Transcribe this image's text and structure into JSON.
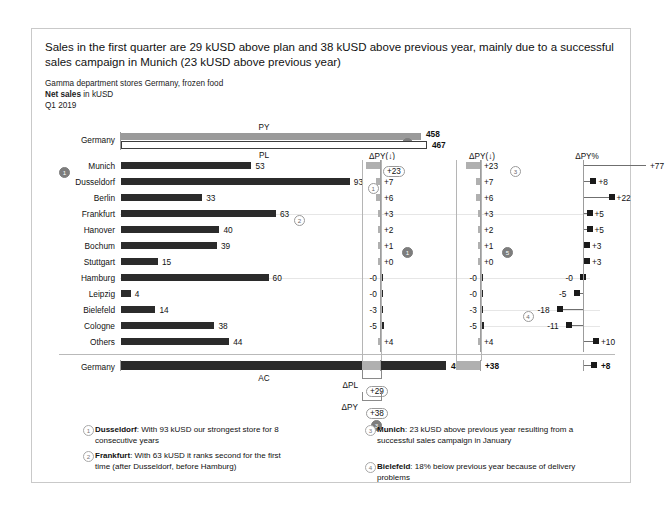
{
  "header": {
    "title": "Sales in the first quarter are 29 kUSD above plan and 38 kUSD above previous year, mainly due to a successful sales campaign in Munich (23 kUSD above previous year)",
    "subtitle_org": "Gamma department stores Germany, frozen food",
    "subtitle_measure_bold": "Net sales",
    "subtitle_measure_rest": " in kUSD",
    "subtitle_period": "Q1 2019"
  },
  "labels": {
    "germany": "Germany",
    "py": "PY",
    "pl": "PL",
    "ac": "AC",
    "delta_py_header": "ΔPY(↓)",
    "delta_py_pct_header": "ΔPY%",
    "delta_pl_bracket": "ΔPL",
    "delta_py_bracket": "ΔPY"
  },
  "totals": {
    "py_value": 458,
    "py_label": "458",
    "pl_value": 467,
    "pl_label": "467",
    "ac_value": 496,
    "ac_label": "496",
    "delta_pl_label": "+29",
    "delta_py_label": "+38",
    "delta_py_col2_label": "+38",
    "delta_py_pct_label": "+8",
    "py_marker": "2",
    "delta_pl_marker": "3"
  },
  "chart_data": {
    "type": "bar",
    "xlabel": "",
    "ylabel": "",
    "categories": [
      "Munich",
      "Dusseldorf",
      "Berlin",
      "Frankfurt",
      "Hanover",
      "Bochum",
      "Stuttgart",
      "Hamburg",
      "Leipzig",
      "Bielefeld",
      "Cologne",
      "Others"
    ],
    "series": [
      {
        "name": "AC",
        "values": [
          53,
          93,
          33,
          63,
          40,
          39,
          15,
          60,
          4,
          14,
          38,
          44
        ]
      },
      {
        "name": "ΔPY",
        "values": [
          23,
          7,
          6,
          3,
          2,
          1,
          0,
          -0.4,
          -0.4,
          -3,
          -5,
          4
        ]
      },
      {
        "name": "ΔPY%",
        "values": [
          77,
          8,
          22,
          5,
          5,
          3,
          3,
          -0.5,
          -5,
          -18,
          -11,
          10
        ]
      }
    ],
    "value_labels": {
      "AC": [
        "53",
        "93",
        "33",
        "63",
        "40",
        "39",
        "15",
        "60",
        "4",
        "14",
        "38",
        "44"
      ],
      "dPY": [
        "+23",
        "+7",
        "+6",
        "+3",
        "+2",
        "+1",
        "+0",
        "-0",
        "-0",
        "-3",
        "-5",
        "+4"
      ],
      "dPYpct": [
        "+77",
        "+8",
        "+22",
        "+5",
        "+5",
        "+3",
        "+3",
        "-0",
        "-5",
        "-18",
        "-11",
        "+10"
      ]
    },
    "totals_row": {
      "AC": 496,
      "PY": 458,
      "PL": 467,
      "dPL": 29,
      "dPY": 38,
      "dPYpct": 8
    },
    "annotations": [
      {
        "id": 1,
        "category": "Dusseldorf"
      },
      {
        "id": 2,
        "category": "Frankfurt"
      },
      {
        "id": 3,
        "category": "Munich"
      },
      {
        "id": 4,
        "category": "Bielefeld"
      }
    ],
    "grid": false,
    "legend": "none",
    "note": "ΔPY% value +77 exceeds the axis scale and is shown clipped with an arrow"
  },
  "rows": [
    {
      "name": "Munich",
      "ac": "53",
      "dpy": "+23",
      "dpypct": "+77",
      "marker": "1",
      "marker_style": "dark"
    },
    {
      "name": "Dusseldorf",
      "ac": "93",
      "dpy": "+7",
      "dpypct": "+8",
      "marker": "1",
      "marker_style": "light-right"
    },
    {
      "name": "Berlin",
      "ac": "33",
      "dpy": "+6",
      "dpypct": "+22",
      "marker": "",
      "marker_style": ""
    },
    {
      "name": "Frankfurt",
      "ac": "63",
      "dpy": "+3",
      "dpypct": "+5",
      "marker": "2",
      "marker_style": "light-right"
    },
    {
      "name": "Hanover",
      "ac": "40",
      "dpy": "+2",
      "dpypct": "+5",
      "marker": "",
      "marker_style": ""
    },
    {
      "name": "Bochum",
      "ac": "39",
      "dpy": "+1",
      "dpypct": "+3",
      "marker": "",
      "marker_style": ""
    },
    {
      "name": "Stuttgart",
      "ac": "15",
      "dpy": "+0",
      "dpypct": "+3",
      "marker": "",
      "marker_style": ""
    },
    {
      "name": "Hamburg",
      "ac": "60",
      "dpy": "-0",
      "dpypct": "-0",
      "marker": "",
      "marker_style": ""
    },
    {
      "name": "Leipzig",
      "ac": "4",
      "dpy": "-0",
      "dpypct": "-5",
      "marker": "",
      "marker_style": ""
    },
    {
      "name": "Bielefeld",
      "ac": "14",
      "dpy": "-3",
      "dpypct": "-18",
      "marker": "4",
      "marker_style": "light-left"
    },
    {
      "name": "Cologne",
      "ac": "38",
      "dpy": "-5",
      "dpypct": "-11",
      "marker": "",
      "marker_style": ""
    },
    {
      "name": "Others",
      "ac": "44",
      "dpy": "+4",
      "dpypct": "+10",
      "marker": "",
      "marker_style": ""
    }
  ],
  "col_markers": {
    "dpy_col1_marker": "1",
    "dpy_col2_top_marker": "3",
    "dpy_col2_mid_marker": "5"
  },
  "footnotes": [
    {
      "id": "1",
      "bold": "Dusseldorf",
      "text": ": With 93 kUSD our strongest store for 8 consecutive years"
    },
    {
      "id": "2",
      "bold": "Frankfurt",
      "text": ": With 63 kUSD it ranks second for the first time (after Dusseldorf, before Hamburg)"
    },
    {
      "id": "3",
      "bold": "Munich",
      "text": ": 23 kUSD above previous year resulting from a successful sales campaign in January"
    },
    {
      "id": "4",
      "bold": "Bielefeld",
      "text": ": 18% below previous year because of delivery problems"
    }
  ],
  "colors": {
    "actual": "#2b2b2b",
    "previous_year": "#9a9a9a",
    "variance_positive": "#b0b0b0",
    "variance_negative": "#262626",
    "axis": "#9c9c9c",
    "frame": "#c9c9c9"
  }
}
